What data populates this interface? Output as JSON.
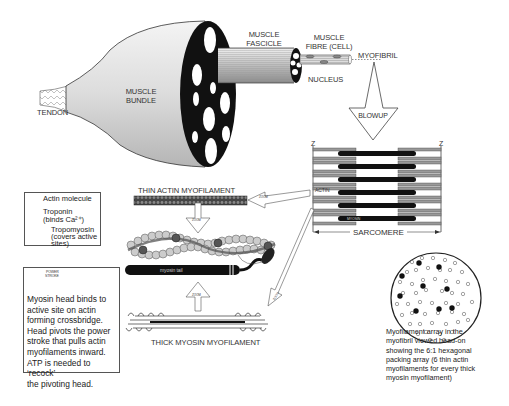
{
  "labels": {
    "tendon": "TENDON",
    "muscle_bundle_1": "MUSCLE",
    "muscle_bundle_2": "BUNDLE",
    "muscle_fascicle_1": "MUSCLE",
    "muscle_fascicle_2": "FASCICLE",
    "muscle_fibre_1": "MUSCLE",
    "muscle_fibre_2": "FIBRE (CELL)",
    "myofibril": "MYOFIBRIL",
    "nucleus": "NUCLEUS",
    "blowup": "BLOWUP",
    "z_left": "Z",
    "z_right": "Z",
    "actin": "ACTIN",
    "myosin": "MYOSIN",
    "sarcomere": "SARCOMERE",
    "thin_actin": "THIN ACTIN MYOFILAMENT",
    "thick_myosin": "THICK MYOSIN MYOFILAMENT",
    "zoom": "ZOOM",
    "myosin_tail": "myosin tail",
    "myosin_head": "myosin head"
  },
  "legend": {
    "items": [
      {
        "label": "Actin molecule"
      },
      {
        "label": "Troponin",
        "sub": "(binds Ca²⁺)"
      },
      {
        "label": "Tropomyosin",
        "sub": "(covers active sites)"
      }
    ]
  },
  "crossbridge_box": {
    "power_stroke_1": "POWER",
    "power_stroke_2": "STROKE",
    "lines": [
      "Myosin head binds to",
      "active site on actin",
      "forming crossbridge.",
      "Head pivots the power",
      "stroke that pulls actin",
      "myofilaments inward.",
      "ATP is needed to ‘recock’",
      "the pivoting head."
    ]
  },
  "array_caption": {
    "lines": [
      "Myofilament array in the",
      "myofibril viewed head-on",
      "showing the 6:1 hexagonal",
      "packing array (6 thin actin",
      "myofilaments for every thick",
      "myosin myofilament)"
    ]
  },
  "colors": {
    "line": "#333333",
    "fill_gray": "#c8c8c8",
    "dark": "#111111",
    "bead": "#cfcfcf"
  }
}
